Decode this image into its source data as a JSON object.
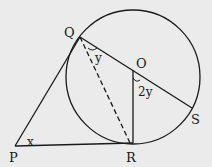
{
  "diagram": {
    "points": {
      "P": "P",
      "Q": "Q",
      "O": "O",
      "R": "R",
      "S": "S"
    },
    "angles": {
      "at_P": "x",
      "at_Q": "y",
      "at_O": "2y"
    },
    "colors": {
      "background": "#ebebeb",
      "stroke": "#1a1a1a"
    }
  }
}
